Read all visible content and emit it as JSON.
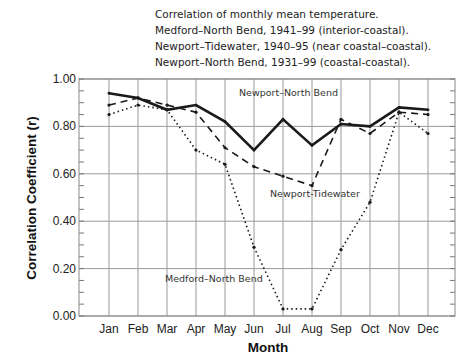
{
  "chart_data": {
    "type": "line",
    "title_lines": [
      "Correlation of monthly mean temperature.",
      "Medford–North Bend, 1941–99 (interior-coastal).",
      "Newport–Tidewater, 1940–95 (near coastal–coastal).",
      "Newport–North Bend, 1931–99 (coastal-coastal)."
    ],
    "xlabel": "Month",
    "ylabel": "Correlation Coefficient (r)",
    "categories": [
      "Jan",
      "Feb",
      "Mar",
      "Apr",
      "May",
      "Jun",
      "Jul",
      "Aug",
      "Sep",
      "Oct",
      "Nov",
      "Dec"
    ],
    "ylim": [
      0,
      1
    ],
    "yticks": [
      "0.00",
      "0.20",
      "0.40",
      "0.60",
      "0.80",
      "1.00"
    ],
    "ytick_values": [
      0,
      0.2,
      0.4,
      0.6,
      0.8,
      1.0
    ],
    "grid": true,
    "series": [
      {
        "name": "Newport–North Bend",
        "style": "solid",
        "values": [
          0.94,
          0.92,
          0.87,
          0.89,
          0.82,
          0.7,
          0.83,
          0.72,
          0.81,
          0.8,
          0.88,
          0.87
        ]
      },
      {
        "name": "Newport-Tidewater",
        "style": "dashed",
        "values": [
          0.89,
          0.92,
          0.89,
          0.86,
          0.71,
          0.63,
          0.59,
          0.55,
          0.83,
          0.77,
          0.86,
          0.85
        ]
      },
      {
        "name": "Medford–North Bend",
        "style": "dotted",
        "values": [
          0.85,
          0.89,
          0.87,
          0.7,
          0.64,
          0.29,
          0.03,
          0.03,
          0.28,
          0.48,
          0.86,
          0.77
        ]
      }
    ],
    "annotations": [
      "Newport–North Bend",
      "Newport-Tidewater",
      "Medford–North Bend"
    ]
  }
}
